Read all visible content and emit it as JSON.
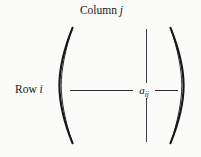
{
  "figure": {
    "type": "matrix-element-diagram",
    "background_color": "#fbfbfa",
    "ink_color": "#16161a"
  },
  "labels": {
    "column": {
      "text": "Column",
      "variable": "j"
    },
    "row": {
      "text": "Row",
      "variable": "i"
    }
  },
  "element": {
    "base": "a",
    "subscript": "ij"
  },
  "delimiters": {
    "left": "(",
    "right": ")"
  },
  "rules": {
    "column_rule": "vertical-line",
    "row_rule_left": "horizontal-line",
    "row_rule_right": "horizontal-line"
  }
}
